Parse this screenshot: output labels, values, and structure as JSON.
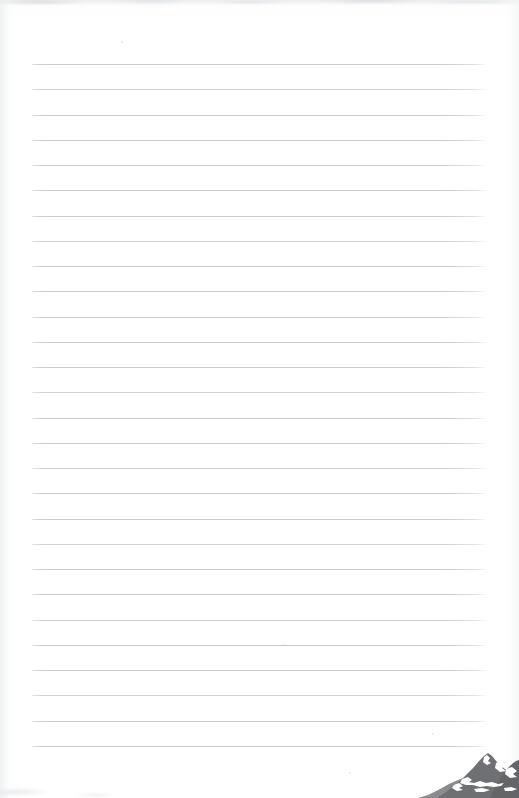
{
  "document": {
    "kind": "scanned-lined-notepad-page",
    "title": "Blank Ruled Notepad Page",
    "page_width": 519,
    "page_height": 798,
    "background_color": "#ffffff",
    "content_text": ""
  },
  "ruling": {
    "line_count": 28,
    "first_line_y": 64,
    "line_spacing": 25.25,
    "line_start_x": 32,
    "line_end_x": 488,
    "line_thickness": 1,
    "line_color": "#c7ccd1",
    "line_color_faint": "#dfe3e6"
  },
  "logo": {
    "name": "mountain-peak-logo",
    "description": "Grayscale mountain range silhouette with snow patches",
    "x": 418,
    "y": 752,
    "width": 101,
    "height": 46,
    "fill_color": "#6e7073",
    "shadow_color": "#8a8c8f",
    "snow_color": "#ffffff"
  },
  "artifacts": {
    "top_edge_smudge": true,
    "left_margin_shading": true,
    "right_margin_shading": true,
    "specks": [
      {
        "x": 283,
        "y": 644,
        "size": 2
      },
      {
        "x": 432,
        "y": 733,
        "size": 2
      },
      {
        "x": 349,
        "y": 772,
        "size": 2
      },
      {
        "x": 121,
        "y": 41,
        "size": 2
      }
    ]
  }
}
